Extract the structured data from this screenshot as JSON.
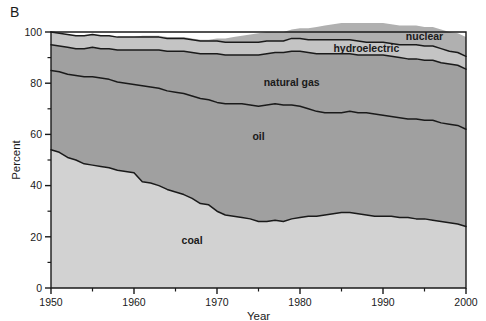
{
  "figure": {
    "panel_letter": "B",
    "background_color": "#ffffff"
  },
  "axes": {
    "x": {
      "title": "Year",
      "tick_labels": [
        "1950",
        "1960",
        "1970",
        "1980",
        "1990",
        "2000"
      ],
      "tick_values": [
        1950,
        1960,
        1970,
        1980,
        1990,
        2000
      ],
      "minor_tick_values": [
        1955,
        1965,
        1975,
        1985,
        1995
      ],
      "range": [
        1950,
        2000
      ]
    },
    "y": {
      "title": "Percent",
      "tick_labels": [
        "0",
        "20",
        "40",
        "60",
        "80",
        "100"
      ],
      "tick_values": [
        0,
        20,
        40,
        60,
        80,
        100
      ],
      "minor_tick_values": [
        10,
        30,
        50,
        70,
        90
      ],
      "range": [
        0,
        100
      ]
    }
  },
  "series_labels": {
    "coal": "coal",
    "oil": "oil",
    "natural_gas": "natural gas",
    "hydroelectric": "hydroelectric",
    "nuclear": "nuclear"
  },
  "colors": {
    "coal": "#d2d2d2",
    "oil": "#a0a0a0",
    "natural_gas": "#a0a0a0",
    "hydroelectric": "#c4c4c4",
    "nuclear": "#b0b0b0",
    "line": "#1a1a1a",
    "axis": "#1a1a1a",
    "text": "#1a1a1a"
  },
  "chart_data": {
    "type": "area",
    "title": "",
    "subtitle": "",
    "xlabel": "Year",
    "ylabel": "Percent",
    "xlim": [
      1950,
      2000
    ],
    "ylim": [
      0,
      100
    ],
    "grid": false,
    "legend_position": "inline-labels",
    "stacked": true,
    "stack_order": [
      "coal",
      "oil",
      "natural gas",
      "hydroelectric",
      "nuclear"
    ],
    "x": [
      1950,
      1951,
      1952,
      1953,
      1954,
      1955,
      1956,
      1957,
      1958,
      1959,
      1960,
      1961,
      1962,
      1963,
      1964,
      1965,
      1966,
      1967,
      1968,
      1969,
      1970,
      1971,
      1972,
      1973,
      1974,
      1975,
      1976,
      1977,
      1978,
      1979,
      1980,
      1981,
      1982,
      1983,
      1984,
      1985,
      1986,
      1987,
      1988,
      1989,
      1990,
      1991,
      1992,
      1993,
      1994,
      1995,
      1996,
      1997,
      1998,
      1999,
      2000
    ],
    "series": [
      {
        "name": "coal",
        "values": [
          54.0,
          53.0,
          51.0,
          50.0,
          48.5,
          48.0,
          47.5,
          47.0,
          46.0,
          45.5,
          45.0,
          41.5,
          41.0,
          40.0,
          38.5,
          37.5,
          36.5,
          35.0,
          33.0,
          32.5,
          30.0,
          28.5,
          28.0,
          27.5,
          27.0,
          26.0,
          26.0,
          26.5,
          26.0,
          27.0,
          27.5,
          28.0,
          28.0,
          28.5,
          29.0,
          29.5,
          29.5,
          29.0,
          28.5,
          28.0,
          28.0,
          28.0,
          27.5,
          27.5,
          27.0,
          27.0,
          26.5,
          26.0,
          25.5,
          25.0,
          24.0
        ]
      },
      {
        "name": "oil",
        "values": [
          31.0,
          31.5,
          32.5,
          33.0,
          34.0,
          34.5,
          34.5,
          34.5,
          34.5,
          34.5,
          34.5,
          37.5,
          37.5,
          38.0,
          38.5,
          39.0,
          39.5,
          40.0,
          41.0,
          41.0,
          42.5,
          43.5,
          44.0,
          44.5,
          44.5,
          45.0,
          45.5,
          45.5,
          45.5,
          44.5,
          43.5,
          42.0,
          41.0,
          40.0,
          39.5,
          39.0,
          39.5,
          39.5,
          40.0,
          40.0,
          39.5,
          39.0,
          39.0,
          38.5,
          39.0,
          38.5,
          39.0,
          38.5,
          38.5,
          38.5,
          38.0
        ]
      },
      {
        "name": "natural gas",
        "values": [
          10.0,
          10.0,
          10.5,
          10.5,
          11.0,
          11.5,
          11.5,
          12.0,
          12.5,
          13.0,
          13.5,
          14.0,
          14.5,
          15.0,
          15.5,
          16.0,
          16.5,
          17.0,
          17.5,
          18.0,
          19.0,
          19.0,
          19.0,
          19.0,
          19.5,
          20.0,
          20.0,
          20.0,
          20.5,
          21.0,
          21.5,
          22.0,
          22.5,
          23.0,
          23.0,
          23.0,
          22.5,
          22.5,
          22.5,
          23.0,
          23.5,
          23.5,
          23.5,
          23.5,
          23.5,
          23.5,
          23.5,
          23.5,
          23.5,
          23.5,
          23.5
        ]
      },
      {
        "name": "hydroelectric",
        "values": [
          5.0,
          5.0,
          5.0,
          5.0,
          5.0,
          5.0,
          5.0,
          5.0,
          5.0,
          5.0,
          5.0,
          5.0,
          5.0,
          5.0,
          5.0,
          5.0,
          5.0,
          5.0,
          5.0,
          5.0,
          5.0,
          5.0,
          5.0,
          5.0,
          5.0,
          5.0,
          5.0,
          4.5,
          4.5,
          5.0,
          5.0,
          5.0,
          5.5,
          5.5,
          5.5,
          5.5,
          5.5,
          5.5,
          5.0,
          5.0,
          5.0,
          5.0,
          5.0,
          5.5,
          5.5,
          5.5,
          5.5,
          5.5,
          5.0,
          5.0,
          5.0
        ]
      },
      {
        "name": "nuclear",
        "values": [
          0.0,
          0.0,
          0.0,
          0.0,
          0.0,
          0.0,
          0.0,
          0.0,
          0.0,
          0.0,
          0.0,
          0.5,
          0.5,
          0.5,
          0.5,
          0.5,
          0.5,
          0.5,
          0.5,
          0.5,
          1.0,
          1.5,
          2.0,
          2.5,
          3.0,
          3.5,
          3.5,
          3.5,
          3.5,
          3.5,
          4.0,
          4.5,
          5.0,
          5.5,
          6.0,
          6.5,
          6.5,
          7.0,
          7.5,
          7.5,
          7.5,
          7.5,
          7.5,
          7.5,
          7.5,
          7.5,
          7.5,
          7.5,
          7.5,
          7.5,
          7.5
        ]
      }
    ],
    "annotations": [
      {
        "text": "nuclear",
        "x": 1995,
        "y": 97
      },
      {
        "text": "hydroelectric",
        "x": 1988,
        "y": 92
      },
      {
        "text": "natural gas",
        "x": 1979,
        "y": 79
      },
      {
        "text": "oil",
        "x": 1975,
        "y": 58
      },
      {
        "text": "coal",
        "x": 1967,
        "y": 17
      }
    ]
  }
}
